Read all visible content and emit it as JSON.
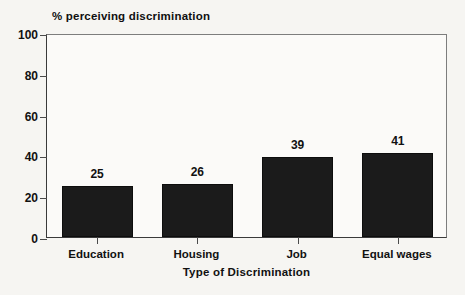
{
  "chart_data": {
    "type": "bar",
    "title": "% perceiving discrimination",
    "xlabel": "Type of Discrimination",
    "ylabel": "% perceiving discrimination",
    "categories": [
      "Education",
      "Housing",
      "Job",
      "Equal wages"
    ],
    "values": [
      25,
      26,
      39,
      41
    ],
    "value_labels": [
      "25",
      "26",
      "39",
      "41"
    ],
    "ylim": [
      0,
      100
    ],
    "ytick_values": [
      0,
      20,
      40,
      60,
      80,
      100
    ],
    "ytick_labels": [
      "0",
      "20",
      "40",
      "60",
      "80",
      "100"
    ],
    "grid": false,
    "legend": false,
    "bar_color": "#1b1b1b",
    "background_color": "#f6f5f2",
    "plot_background_color": "#fbfaf8",
    "axis_color": "#3a3a3a"
  }
}
